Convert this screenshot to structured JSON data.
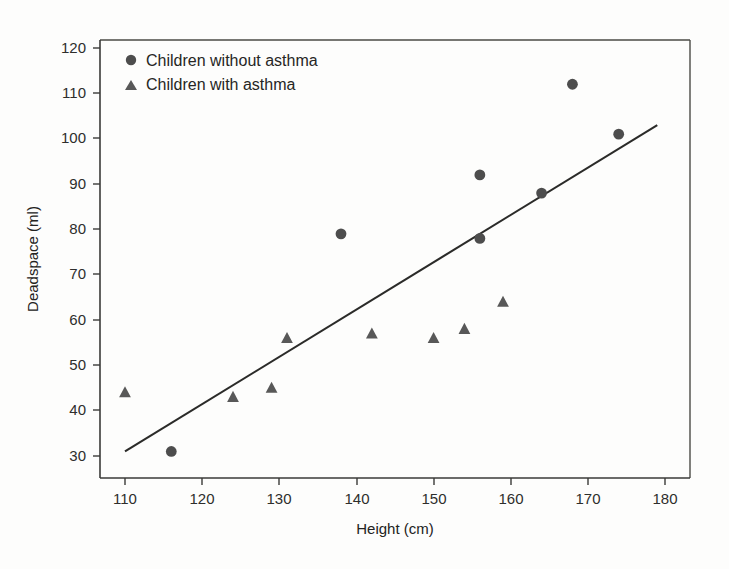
{
  "chart_data": {
    "type": "scatter",
    "title": "",
    "xlabel": "Height (cm)",
    "ylabel": "Deadspace (ml)",
    "xlim": [
      105,
      182
    ],
    "ylim": [
      26,
      124
    ],
    "xticks": [
      110,
      120,
      130,
      140,
      150,
      160,
      170,
      180
    ],
    "yticks": [
      30,
      40,
      50,
      60,
      70,
      80,
      90,
      100,
      110,
      120
    ],
    "grid": false,
    "legend_position": "top-left",
    "series": [
      {
        "name": "Children without asthma",
        "marker": "circle",
        "color": "#4d4d4d",
        "points": [
          {
            "x": 116,
            "y": 31
          },
          {
            "x": 138,
            "y": 79
          },
          {
            "x": 156,
            "y": 78
          },
          {
            "x": 156,
            "y": 92
          },
          {
            "x": 164,
            "y": 88
          },
          {
            "x": 168,
            "y": 112
          },
          {
            "x": 174,
            "y": 101
          }
        ]
      },
      {
        "name": "Children with asthma",
        "marker": "triangle",
        "color": "#585858",
        "points": [
          {
            "x": 110,
            "y": 44
          },
          {
            "x": 124,
            "y": 43
          },
          {
            "x": 129,
            "y": 45
          },
          {
            "x": 131,
            "y": 56
          },
          {
            "x": 142,
            "y": 57
          },
          {
            "x": 150,
            "y": 56
          },
          {
            "x": 154,
            "y": 58
          },
          {
            "x": 159,
            "y": 64
          }
        ]
      }
    ],
    "fit_line": {
      "name": "regression-line",
      "x_start": 110,
      "y_start": 31,
      "x_end": 179,
      "y_end": 103
    },
    "annotations": []
  },
  "legend": {
    "entries": [
      {
        "label": "Children without asthma",
        "marker": "circle"
      },
      {
        "label": "Children with asthma",
        "marker": "triangle"
      }
    ]
  },
  "axes": {
    "x_title": "Height (cm)",
    "y_title": "Deadspace (ml)",
    "x_tick_labels": [
      "110",
      "120",
      "130",
      "140",
      "150",
      "160",
      "170",
      "180"
    ],
    "y_tick_labels": [
      "30",
      "40",
      "50",
      "60",
      "70",
      "80",
      "90",
      "100",
      "110",
      "120"
    ]
  }
}
